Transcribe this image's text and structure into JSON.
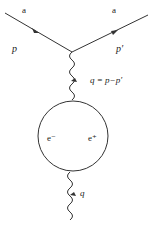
{
  "diagram": {
    "type": "feynman",
    "incoming": {
      "particle_label": "a",
      "momentum_label": "p"
    },
    "outgoing": {
      "particle_label": "a",
      "momentum_label": "p′"
    },
    "photon_upper": {
      "label": "q = p−p′"
    },
    "loop": {
      "left_label": "e⁻",
      "right_label": "e⁺"
    },
    "photon_lower": {
      "label": "q"
    },
    "colors": {
      "line": "#333333",
      "text": "#222222",
      "background": "#ffffff"
    }
  }
}
